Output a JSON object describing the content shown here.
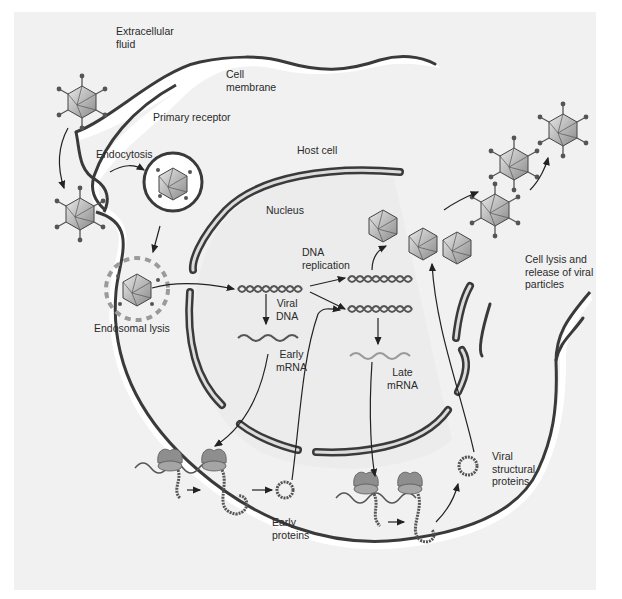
{
  "diagram": {
    "labels": {
      "extracellular_fluid": "Extracellular\nfluid",
      "cell_membrane": "Cell\nmembrane",
      "primary_receptor": "Primary receptor",
      "endocytosis": "Endocytosis",
      "host_cell": "Host cell",
      "nucleus": "Nucleus",
      "endosomal_lysis": "Endosomal lysis",
      "dna_replication": "DNA\nreplication",
      "viral_dna": "Viral\nDNA",
      "early_mrna": "Early\nmRNA",
      "late_mrna": "Late\nmRNA",
      "early_proteins": "Early\nproteins",
      "viral_structural_proteins": "Viral\nstructural\nproteins",
      "cell_lysis": "Cell lysis and\nrelease of viral\nparticles"
    },
    "colors": {
      "background": "#ffffff",
      "panel": "#f1f1f1",
      "cell_interior": "#ffffff",
      "nucleus_interior": "#ececec",
      "membrane": "#3a3a3a",
      "virus_fill": "#bdbdbd",
      "ribosome": "#8e8e8e",
      "text": "#2a2a2a"
    },
    "stages": [
      "Attachment to primary receptor",
      "Endocytosis",
      "Endosomal lysis",
      "Viral DNA enters nucleus",
      "Early mRNA transcription",
      "Early protein translation",
      "DNA replication",
      "Late mRNA transcription",
      "Viral structural protein translation",
      "Assembly",
      "Cell lysis and release of viral particles"
    ]
  }
}
